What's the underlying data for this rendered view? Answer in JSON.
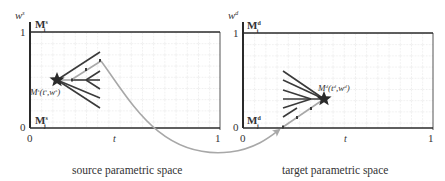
{
  "panels": {
    "source": {
      "caption": "source parametric space",
      "y_axis_label": "w",
      "y_axis_sup": "s",
      "x_axis_label": "t",
      "y_tick_top": "1",
      "y_tick_bottom": "0",
      "x_tick_left": "0",
      "x_tick_right": "1",
      "top_boundary_label": "M",
      "top_boundary_sup": "s",
      "top_boundary_sub": "i",
      "bottom_boundary_label": "M",
      "bottom_boundary_sup": "s",
      "bottom_boundary_sub": "j",
      "point_label": "M",
      "point_sup": "s",
      "point_args": "(t",
      "point_args_sup1": "s",
      "point_args_mid": ",w",
      "point_args_sup2": "s",
      "point_args_end": ")"
    },
    "target": {
      "caption": "target parametric space",
      "y_axis_label": "w",
      "y_axis_sup": "d",
      "x_axis_label": "t",
      "y_tick_top": "1",
      "y_tick_bottom": "0",
      "x_tick_left": "0",
      "x_tick_right": "1",
      "top_boundary_label": "M",
      "top_boundary_sup": "d",
      "top_boundary_sub": "i",
      "bottom_boundary_label": "M",
      "bottom_boundary_sup": "d",
      "bottom_boundary_sub": "j",
      "point_label": "M",
      "point_sup": "d",
      "point_args": "(t",
      "point_args_sup1": "d",
      "point_args_mid": ",w",
      "point_args_sup2": "d",
      "point_args_end": ")"
    }
  },
  "colors": {
    "axis": "#2a2a2a",
    "grid": "#c8c8c8",
    "fan": "#3a3a3a",
    "highlight_path": "#a8a8a8",
    "arrow": "#a8a8a8",
    "star": "#2a2a2a"
  }
}
